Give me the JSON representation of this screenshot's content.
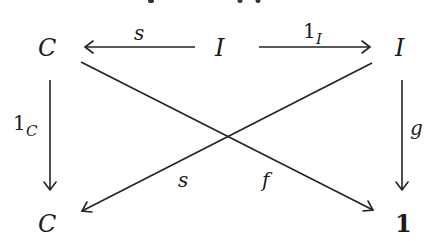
{
  "diagram": {
    "type": "commutative-diagram",
    "objects": {
      "top_left": "C",
      "top_middle": "I",
      "top_right": "I",
      "bottom_left": "C",
      "bottom_right": "1"
    },
    "morphisms": [
      {
        "id": "top_left_arrow",
        "from": "I",
        "to": "C",
        "label": "s"
      },
      {
        "id": "top_right_arrow",
        "from": "I",
        "to": "I",
        "label_main": "1",
        "label_sub": "I"
      },
      {
        "id": "left_vertical",
        "from": "C",
        "to": "C",
        "label_main": "1",
        "label_sub": "C"
      },
      {
        "id": "right_vertical",
        "from": "I",
        "to": "1",
        "label": "g"
      },
      {
        "id": "diag_down_right",
        "from": "C",
        "to": "1",
        "label": "f"
      },
      {
        "id": "diag_down_left",
        "from": "I",
        "to": "C",
        "label": "s"
      }
    ],
    "colors": {
      "ink": "#1a1a1a",
      "background": "#ffffff"
    }
  }
}
